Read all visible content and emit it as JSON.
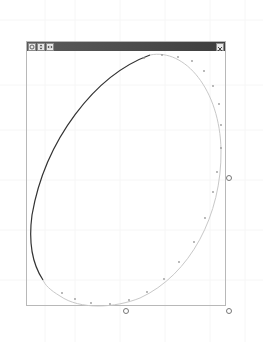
{
  "window": {
    "title": "",
    "buttons": [
      {
        "name": "rotate-button",
        "icon": "rotate-icon",
        "glyph": "↻"
      },
      {
        "name": "flip-vertical-button",
        "icon": "up-down-arrows-icon",
        "glyph": "⇕"
      },
      {
        "name": "flip-horizontal-button",
        "icon": "left-right-arrows-icon",
        "glyph": "◂▸"
      }
    ],
    "close": {
      "name": "close-button",
      "icon": "close-icon",
      "glyph": "×"
    }
  },
  "shape": {
    "type": "ellipse",
    "center": [
      126,
      178
    ],
    "rx": 95,
    "ry": 130,
    "rotation_deg": 25,
    "stroke_dark": "#333333",
    "stroke_light": "#c8c8c8",
    "control_point_color": "#9a9a9a"
  },
  "handles": [
    {
      "name": "resize-handle-right",
      "x": 229,
      "y": 178
    },
    {
      "name": "resize-handle-bottom",
      "x": 126,
      "y": 311
    },
    {
      "name": "resize-handle-bottom-right",
      "x": 229,
      "y": 311
    }
  ],
  "colors": {
    "titlebar": "#4a4a4a",
    "frame": "#b8b8b8",
    "background": "#ffffff"
  },
  "caption": ""
}
